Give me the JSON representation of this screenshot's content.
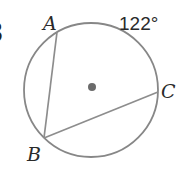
{
  "diagram": {
    "angle_label": "122°",
    "points": {
      "a": "A",
      "b": "B",
      "c": "C"
    },
    "segments": [
      "AB",
      "BC"
    ],
    "center_dot": true,
    "cropped_left_char": "3",
    "colors": {
      "circle_stroke": "#878787",
      "chord_stroke": "#8d8d8d",
      "center_dot": "#6b6b6b",
      "label_text": "#2a2a2a",
      "background": "#ffffff"
    }
  }
}
